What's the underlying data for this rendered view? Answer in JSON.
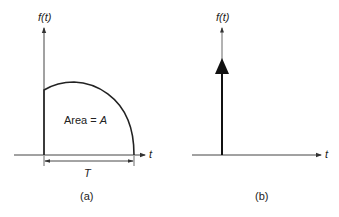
{
  "panel_a": {
    "y_label": "f(t)",
    "x_label": "t",
    "area_label_prefix": "Area = ",
    "area_label_var": "A",
    "duration_label": "T",
    "caption": "(a)"
  },
  "panel_b": {
    "y_label": "f(t)",
    "x_label": "t",
    "caption": "(b)"
  },
  "colors": {
    "line": "#222222",
    "axis": "#444444"
  }
}
